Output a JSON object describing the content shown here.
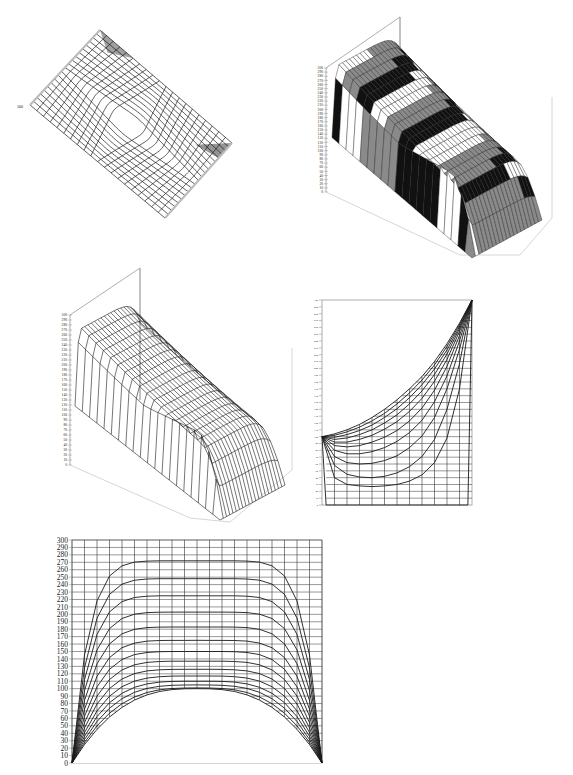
{
  "page": {
    "background": "#ffffff",
    "line_color": "#1a1a1a",
    "grid_color": "#333333",
    "axis_color": "#999999",
    "band_dark": "#111111",
    "band_mid": "#8a8a8a"
  },
  "chart_data": [
    {
      "id": "chart1",
      "type": "surface-3d",
      "title": "",
      "view": "top-down rotated wireframe",
      "z_axis_visible_label": "300",
      "grid": {
        "rows": 20,
        "cols": 20
      },
      "corners": {
        "top": [
          100,
          30
        ],
        "left": [
          30,
          105
        ],
        "bottom": [
          165,
          218
        ],
        "right": [
          232,
          143
        ]
      },
      "description": "Wireframe surface viewed from above; dense/dark regions at the top and right corners where values rise to 300"
    },
    {
      "id": "chart2",
      "type": "surface-3d",
      "title": "",
      "zlabel_ticks": [
        0,
        10,
        20,
        30,
        40,
        50,
        60,
        70,
        80,
        90,
        100,
        110,
        120,
        130,
        140,
        150,
        160,
        170,
        180,
        190,
        200,
        210,
        220,
        230,
        240,
        250,
        260,
        270,
        280,
        290,
        300
      ],
      "zlim": [
        0,
        300
      ],
      "fill": "banded (alternating dark / grey / white contour bands)",
      "grid": {
        "rows": 20,
        "cols": 20
      },
      "description": "Perspective surface with left edge rising to 300, center plateau, right-bottom cusp; banded shading"
    },
    {
      "id": "chart3",
      "type": "surface-3d",
      "title": "",
      "zlabel_ticks": [
        0,
        10,
        20,
        30,
        40,
        50,
        60,
        70,
        80,
        90,
        100,
        110,
        120,
        130,
        140,
        150,
        160,
        170,
        180,
        190,
        200,
        210,
        220,
        230,
        240,
        250,
        260,
        270,
        280,
        290,
        300
      ],
      "zlim": [
        0,
        300
      ],
      "fill": "wireframe",
      "grid": {
        "rows": 20,
        "cols": 20
      },
      "description": "Same surface as chart2, unshaded wireframe"
    },
    {
      "id": "chart4",
      "type": "line",
      "title": "",
      "xlabel": "",
      "ylabel": "",
      "ylim": [
        0,
        300
      ],
      "yticks": [
        0,
        10,
        20,
        30,
        40,
        50,
        60,
        70,
        80,
        90,
        100,
        110,
        120,
        130,
        140,
        150,
        160,
        170,
        180,
        190,
        200,
        210,
        220,
        230,
        240,
        250,
        260,
        270,
        280,
        290,
        300
      ],
      "x": [
        0,
        1,
        2,
        3,
        4,
        5,
        6,
        7,
        8,
        9,
        10,
        11,
        12
      ],
      "grid": true,
      "series": [
        {
          "name": "s1",
          "values": [
            100,
            104,
            110,
            118,
            128,
            140,
            154,
            170,
            188,
            210,
            236,
            266,
            300
          ]
        },
        {
          "name": "s2",
          "values": [
            100,
            102,
            107,
            114,
            123,
            134,
            148,
            164,
            183,
            205,
            232,
            264,
            300
          ]
        },
        {
          "name": "s3",
          "values": [
            100,
            99,
            103,
            109,
            117,
            128,
            141,
            157,
            176,
            199,
            227,
            261,
            300
          ]
        },
        {
          "name": "s4",
          "values": [
            100,
            96,
            98,
            103,
            110,
            120,
            132,
            148,
            167,
            191,
            221,
            258,
            300
          ]
        },
        {
          "name": "s5",
          "values": [
            100,
            92,
            92,
            96,
            102,
            111,
            122,
            137,
            156,
            181,
            213,
            254,
            300
          ]
        },
        {
          "name": "s6",
          "values": [
            100,
            87,
            85,
            87,
            92,
            99,
            109,
            123,
            142,
            168,
            203,
            248,
            300
          ]
        },
        {
          "name": "s7",
          "values": [
            100,
            80,
            75,
            75,
            78,
            84,
            93,
            106,
            124,
            151,
            189,
            240,
            300
          ]
        },
        {
          "name": "s8",
          "values": [
            100,
            71,
            62,
            60,
            61,
            65,
            72,
            84,
            101,
            128,
            170,
            228,
            300
          ]
        },
        {
          "name": "s9",
          "values": [
            100,
            58,
            45,
            41,
            40,
            42,
            47,
            56,
            71,
            96,
            140,
            207,
            300
          ]
        },
        {
          "name": "s10",
          "values": [
            100,
            40,
            30,
            28,
            27,
            28,
            30,
            35,
            44,
            62,
            98,
            170,
            300
          ]
        },
        {
          "name": "s11",
          "values": [
            100,
            0,
            0,
            0,
            0,
            0,
            0,
            0,
            0,
            0,
            0,
            0,
            300
          ]
        }
      ]
    },
    {
      "id": "chart5",
      "type": "line",
      "title": "",
      "xlabel": "",
      "ylabel": "",
      "ylim": [
        0,
        300
      ],
      "yticks": [
        0,
        10,
        20,
        30,
        40,
        50,
        60,
        70,
        80,
        90,
        100,
        110,
        120,
        130,
        140,
        150,
        160,
        170,
        180,
        190,
        200,
        210,
        220,
        230,
        240,
        250,
        260,
        270,
        280,
        290,
        300
      ],
      "x": [
        0,
        1,
        2,
        3,
        4,
        5,
        6,
        7,
        8,
        9,
        10,
        11,
        12,
        13,
        14,
        15,
        16,
        17,
        18,
        19,
        20
      ],
      "grid": true,
      "peaks": [
        272,
        248,
        225,
        203,
        183,
        165,
        150,
        137,
        126,
        117,
        110,
        105,
        101,
        100
      ],
      "series_note": "Each curve starts at 0 at x=0 and ends at 0 at x=20, flat-topped at its peak value; lowest envelope peaks at 100"
    }
  ]
}
